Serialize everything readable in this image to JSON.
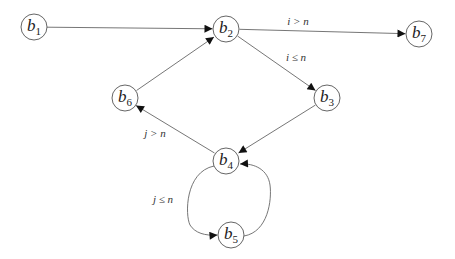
{
  "diagram": {
    "type": "control-flow-graph",
    "nodes": [
      {
        "id": "b1",
        "base": "b",
        "sub": "1",
        "x": 34,
        "y": 27
      },
      {
        "id": "b2",
        "base": "b",
        "sub": "2",
        "x": 226,
        "y": 29
      },
      {
        "id": "b7",
        "base": "b",
        "sub": "7",
        "x": 419,
        "y": 34
      },
      {
        "id": "b6",
        "base": "b",
        "sub": "6",
        "x": 125,
        "y": 98
      },
      {
        "id": "b3",
        "base": "b",
        "sub": "3",
        "x": 327,
        "y": 98
      },
      {
        "id": "b4",
        "base": "b",
        "sub": "4",
        "x": 226,
        "y": 161
      },
      {
        "id": "b5",
        "base": "b",
        "sub": "5",
        "x": 231,
        "y": 235
      }
    ],
    "edges": [
      {
        "from": "b1",
        "to": "b2",
        "label": ""
      },
      {
        "from": "b2",
        "to": "b7",
        "label": "i > n"
      },
      {
        "from": "b2",
        "to": "b3",
        "label": "i ≤ n"
      },
      {
        "from": "b3",
        "to": "b4",
        "label": ""
      },
      {
        "from": "b4",
        "to": "b6",
        "label": "j > n"
      },
      {
        "from": "b6",
        "to": "b2",
        "label": ""
      },
      {
        "from": "b4",
        "to": "b5",
        "label": "j ≤ n"
      },
      {
        "from": "b5",
        "to": "b4",
        "label": ""
      }
    ],
    "edge_labels": {
      "b2_b7": "i > n",
      "b2_b3": "i ≤ n",
      "b4_b6": "j > n",
      "b4_b5": "j ≤ n"
    },
    "node_labels": {
      "b1": {
        "base": "b",
        "sub": "1"
      },
      "b2": {
        "base": "b",
        "sub": "2"
      },
      "b3": {
        "base": "b",
        "sub": "3"
      },
      "b4": {
        "base": "b",
        "sub": "4"
      },
      "b5": {
        "base": "b",
        "sub": "5"
      },
      "b6": {
        "base": "b",
        "sub": "6"
      },
      "b7": {
        "base": "b",
        "sub": "7"
      }
    },
    "colors": {
      "node_stroke": "#555555",
      "edge_stroke": "#666666",
      "arrowhead": "#111111",
      "text": "#222222",
      "background": "#ffffff"
    }
  }
}
